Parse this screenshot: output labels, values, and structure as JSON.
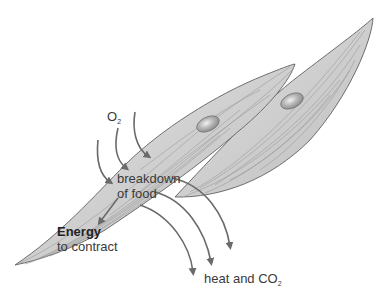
{
  "diagram": {
    "labels": {
      "oxygen": {
        "main": "O",
        "sub": "2"
      },
      "breakdown_line1": "breakdown",
      "breakdown_line2": "of food",
      "energy": "Energy",
      "energy_desc": "to contract",
      "output": {
        "main": "heat and CO",
        "sub": "2"
      }
    },
    "colors": {
      "cell_fill": "#d6d6d6",
      "cell_outline": "#6e6e6e",
      "arrow": "#6a6a6a",
      "nucleus": "#a8a8a8",
      "text": "#3a3a3a"
    },
    "arrows": {
      "inputs": 3,
      "outputs": 3
    }
  }
}
